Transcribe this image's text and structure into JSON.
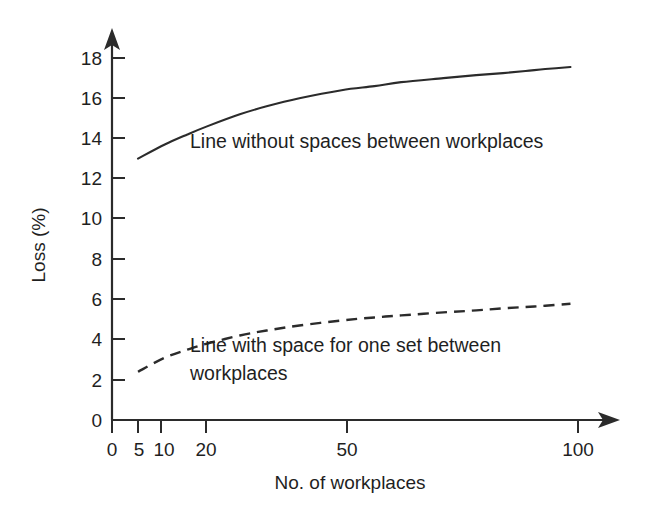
{
  "chart_data": {
    "type": "line",
    "title": "",
    "xlabel": "No. of workplaces",
    "ylabel": "Loss (%)",
    "xscale": "log",
    "yscale": "linear",
    "xlim": [
      4,
      110
    ],
    "ylim": [
      0,
      19
    ],
    "grid": false,
    "legend_position": "inline-annotations",
    "x_ticks": [
      {
        "value": 0,
        "label": "0"
      },
      {
        "value": 5,
        "label": "5"
      },
      {
        "value": 10,
        "label": "10"
      },
      {
        "value": 20,
        "label": "20"
      },
      {
        "value": 50,
        "label": "50"
      },
      {
        "value": 100,
        "label": "100"
      }
    ],
    "y_ticks": [
      {
        "value": 0,
        "label": "0"
      },
      {
        "value": 2,
        "label": "2"
      },
      {
        "value": 4,
        "label": "4"
      },
      {
        "value": 6,
        "label": "6"
      },
      {
        "value": 8,
        "label": "8"
      },
      {
        "value": 10,
        "label": "10"
      },
      {
        "value": 12,
        "label": "12"
      },
      {
        "value": 14,
        "label": "14"
      },
      {
        "value": 16,
        "label": "16"
      },
      {
        "value": 18,
        "label": "18"
      }
    ],
    "series": [
      {
        "name": "Line without spaces between workplaces",
        "style": "solid",
        "color": "#2b2b2b",
        "x": [
          5,
          6,
          7,
          8,
          10,
          12,
          15,
          20,
          25,
          30,
          40,
          50,
          60,
          70,
          80,
          95
        ],
        "values": [
          13.0,
          13.7,
          14.2,
          14.6,
          15.2,
          15.6,
          16.0,
          16.4,
          16.6,
          16.8,
          17.0,
          17.15,
          17.25,
          17.35,
          17.45,
          17.55
        ]
      },
      {
        "name": "Line with space for one set between workplaces",
        "style": "dashed",
        "color": "#2b2b2b",
        "x": [
          5,
          6,
          7,
          8,
          10,
          12,
          15,
          20,
          25,
          30,
          40,
          50,
          60,
          70,
          80,
          95
        ],
        "values": [
          2.4,
          3.1,
          3.5,
          3.8,
          4.2,
          4.45,
          4.7,
          4.95,
          5.1,
          5.2,
          5.35,
          5.45,
          5.55,
          5.62,
          5.68,
          5.78
        ]
      }
    ],
    "annotations": [
      {
        "id": "solid-label",
        "line1": "Line without spaces between workplaces",
        "line2": ""
      },
      {
        "id": "dashed-label",
        "line1": "Line with space for one set between",
        "line2": "workplaces"
      }
    ],
    "colors": {
      "ink": "#2b2b2b",
      "text": "#1f1f1f",
      "background": "#ffffff"
    }
  }
}
